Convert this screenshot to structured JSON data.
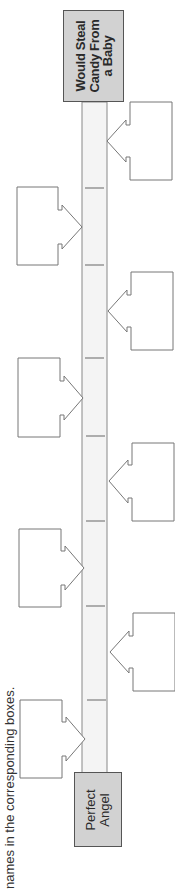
{
  "instruction": "names in the corresponding boxes.",
  "timeline": {
    "top_label": "Would Steal\nCandy From\na Baby",
    "bottom_label": "Perfect\nAngel",
    "tick_count": 8
  },
  "boxes": {
    "left": [
      "",
      "",
      "",
      ""
    ],
    "right": [
      "",
      "",
      "",
      ""
    ]
  },
  "colors": {
    "bar_fill": "#f4f4f4",
    "end_box_fill": "#d2d2d2",
    "line": "#777777"
  }
}
